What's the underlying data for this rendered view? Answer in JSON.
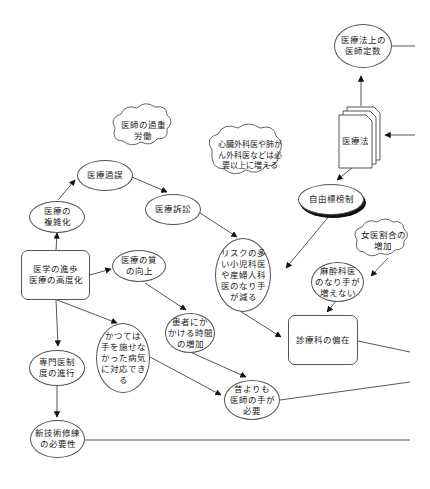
{
  "diagram": {
    "type": "causal-loop / concept map",
    "nodes": {
      "iryouhou_teisuu": "医療法上の\n医師定数",
      "iryouhou": "医療法",
      "ishi_kajou_roudou": "医師の過重\n労働",
      "shinzou_geka": "心臓外科医や肺が\nん外科医などは必\n要以上に増える",
      "iryou_kago": "医療過誤",
      "iryou_soshou": "医療訴訟",
      "jiyuu_hyoubou": "自由標榜制",
      "iryou_fukuzatsu": "医療の\n複雑化",
      "joi_wariai": "女医割合の\n増加",
      "risk_shounika": "リスクの多\nい小児科医\nや産婦人科\n医のなり手\nが減る",
      "igaku_shinpo": "医学の進歩\n医療の高度化",
      "iryou_shitsu": "医療の質\nの向上",
      "masuika": "麻酔科医\nのなり手が\n増えない",
      "kanja_jikan": "患者にか\nかける時間\nの増加",
      "shinryouka_henzai": "診療科の偏在",
      "katsute": "かつては\n手を施せな\nかった病気\nに対応でき\nる",
      "senmon_ishi": "専門医制\n度の進行",
      "mukashi_yori": "昔よりも\n医師の手が\n必要",
      "shingijutsu": "新技術修練\nの必要性"
    },
    "edges": [
      [
        "iryouhou",
        "iryouhou_teisuu"
      ],
      [
        "iryouhou",
        "jiyuu_hyoubou"
      ],
      [
        "igaku_shinpo",
        "iryou_fukuzatsu"
      ],
      [
        "iryou_fukuzatsu",
        "iryou_kago"
      ],
      [
        "iryou_kago",
        "iryou_soshou"
      ],
      [
        "iryou_soshou",
        "risk_shounika"
      ],
      [
        "jiyuu_hyoubou",
        "risk_shounika"
      ],
      [
        "joi_wariai",
        "masuika"
      ],
      [
        "masuika",
        "shinryouka_henzai"
      ],
      [
        "risk_shounika",
        "shinryouka_henzai"
      ],
      [
        "igaku_shinpo",
        "iryou_shitsu"
      ],
      [
        "iryou_shitsu",
        "kanja_jikan"
      ],
      [
        "igaku_shinpo",
        "katsute"
      ],
      [
        "igaku_shinpo",
        "senmon_ishi"
      ],
      [
        "senmon_ishi",
        "shingijutsu"
      ],
      [
        "kanja_jikan",
        "mukashi_yori"
      ],
      [
        "katsute",
        "mukashi_yori"
      ]
    ],
    "line_color": "#333333"
  }
}
